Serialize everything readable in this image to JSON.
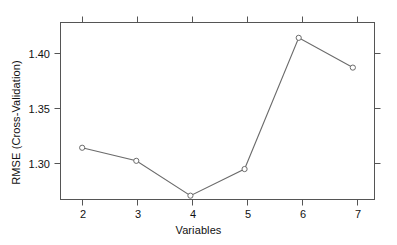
{
  "chart_data": {
    "type": "line",
    "title": "",
    "xlabel": "Variables",
    "ylabel": "RMSE (Cross-Validation)",
    "x": [
      2,
      3,
      4,
      5,
      6,
      7
    ],
    "values": [
      1.3234,
      1.3118,
      1.2809,
      1.3045,
      1.4209,
      1.3945
    ],
    "categories": [
      "2",
      "3",
      "4",
      "5",
      "6",
      "7"
    ],
    "xtick_labels": [
      "2",
      "3",
      "4",
      "5",
      "6",
      "7"
    ],
    "ytick_labels": [
      "1.30",
      "1.35",
      "1.40"
    ],
    "ytick_values": [
      1.3,
      1.35,
      1.4
    ],
    "xlim": [
      1.6,
      7.4
    ],
    "ylim": [
      1.2775,
      1.4345
    ],
    "grid": false,
    "legend": null,
    "marker": "open-circle",
    "line_color": "#6b6b6b",
    "marker_color": "#6b6b6b",
    "axis_color": "#555555",
    "background": "#ffffff"
  },
  "axes": {
    "x_title": "Variables",
    "y_title": "RMSE (Cross-Validation)"
  }
}
